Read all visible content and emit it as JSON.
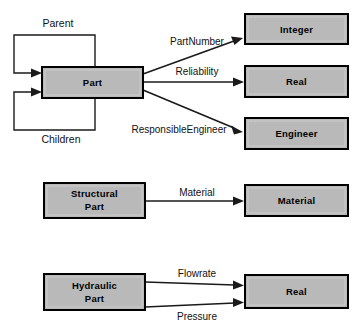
{
  "diagram": {
    "type": "entity-relationship-diagram",
    "title": "",
    "colors": {
      "box_fill": "#b9b9b9",
      "box_border": "#000000",
      "line": "#1a1a1a",
      "background": "#ffffff"
    },
    "groups": [
      {
        "name": "part-group",
        "source": {
          "id": "part",
          "label": "Part",
          "x": 42,
          "y": 67,
          "w": 101,
          "h": 31
        },
        "self_loops": [
          {
            "id": "parent",
            "label": "Parent",
            "label_x": 58,
            "label_y": 27
          },
          {
            "id": "children",
            "label": "Children",
            "label_x": 61,
            "label_y": 143
          }
        ],
        "targets": [
          {
            "id": "integer",
            "label": "Integer",
            "x": 245,
            "y": 14,
            "w": 103,
            "h": 30
          },
          {
            "id": "real-top",
            "label": "Real",
            "x": 245,
            "y": 66,
            "w": 103,
            "h": 31
          },
          {
            "id": "engineer",
            "label": "Engineer",
            "x": 245,
            "y": 118,
            "w": 103,
            "h": 31
          }
        ],
        "edges": [
          {
            "id": "partnumber",
            "label": "PartNumber",
            "label_x": 197,
            "label_y": 45,
            "from": "part",
            "to": "integer"
          },
          {
            "id": "reliability",
            "label": "Reliability",
            "label_x": 197,
            "label_y": 75,
            "from": "part",
            "to": "real-top"
          },
          {
            "id": "responsibleengineer",
            "label": "ResponsibleEngineer",
            "label_x": 179,
            "label_y": 133,
            "from": "part",
            "to": "engineer"
          }
        ]
      },
      {
        "name": "structural-part-group",
        "source": {
          "id": "structural-part",
          "label_line1": "Structural",
          "label_line2": "Part",
          "x": 44,
          "y": 183,
          "w": 101,
          "h": 35
        },
        "self_loops": [],
        "targets": [
          {
            "id": "material",
            "label": "Material",
            "x": 245,
            "y": 185,
            "w": 103,
            "h": 31
          }
        ],
        "edges": [
          {
            "id": "material-edge",
            "label": "Material",
            "label_x": 197,
            "label_y": 196,
            "from": "structural-part",
            "to": "material"
          }
        ]
      },
      {
        "name": "hydraulic-part-group",
        "source": {
          "id": "hydraulic-part",
          "label_line1": "Hydraulic",
          "label_line2": "Part",
          "x": 44,
          "y": 274,
          "w": 101,
          "h": 36
        },
        "self_loops": [],
        "targets": [
          {
            "id": "real-bottom",
            "label": "Real",
            "x": 245,
            "y": 275,
            "w": 103,
            "h": 33
          }
        ],
        "edges": [
          {
            "id": "flowrate",
            "label": "Flowrate",
            "label_x": 197,
            "label_y": 277,
            "from": "hydraulic-part",
            "to": "real-bottom"
          },
          {
            "id": "pressure",
            "label": "Pressure",
            "label_x": 197,
            "label_y": 320,
            "from": "hydraulic-part",
            "to": "real-bottom"
          }
        ]
      }
    ]
  }
}
